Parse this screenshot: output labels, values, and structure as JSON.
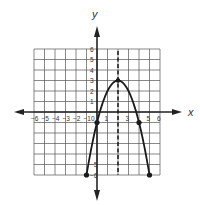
{
  "chart_data": {
    "type": "line",
    "title": "",
    "xlabel": "x",
    "ylabel": "y",
    "xlim": [
      -6,
      6
    ],
    "ylim": [
      -6,
      6
    ],
    "grid": true,
    "x_ticks": [
      "-6",
      "-5",
      "-4",
      "-3",
      "-2",
      "-1",
      "0",
      "1",
      "3",
      "5",
      "6"
    ],
    "y_ticks": [
      "6",
      "5",
      "4",
      "3",
      "2",
      "1",
      "-5",
      "-6"
    ],
    "function": "y = -(x - 2)^2 + 3",
    "series": [
      {
        "name": "parabola",
        "x": [
          -1,
          0,
          1,
          2,
          3,
          4,
          5
        ],
        "y": [
          -6,
          -1,
          2,
          3,
          2,
          -1,
          -6
        ]
      }
    ],
    "marked_points": [
      {
        "x": -1,
        "y": -6
      },
      {
        "x": 0,
        "y": -1
      },
      {
        "x": 2,
        "y": 3
      },
      {
        "x": 4,
        "y": -1
      },
      {
        "x": 5,
        "y": -6
      }
    ],
    "axis_of_symmetry": {
      "x": 2,
      "style": "dashed"
    }
  },
  "labels": {
    "x_axis": "x",
    "y_axis": "y"
  },
  "colors": {
    "grid": "#555555",
    "axis": "#222222",
    "curve": "#1a1a1a"
  }
}
